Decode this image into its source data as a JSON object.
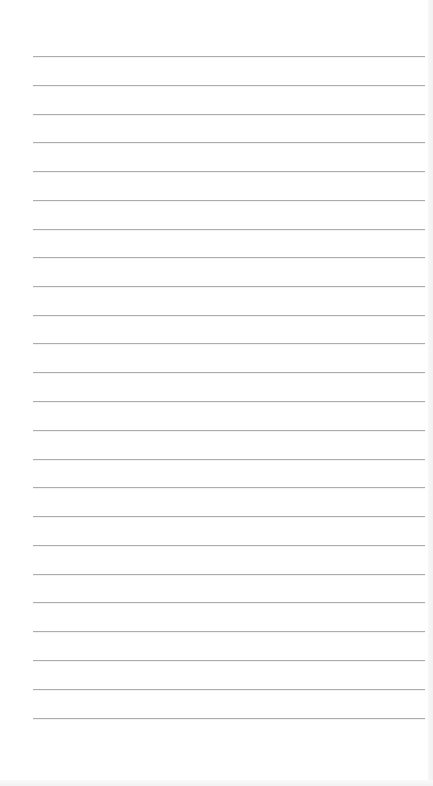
{
  "page": {
    "type": "ruled-paper",
    "background_color": "#ffffff",
    "line_color": "#adadad",
    "line_count": 24,
    "line_left": 33,
    "line_width": 392,
    "line_positions": [
      56,
      85,
      114,
      142,
      171,
      200,
      229,
      257,
      286,
      315,
      343,
      372,
      401,
      430,
      459,
      487,
      516,
      545,
      574,
      602,
      631,
      660,
      689,
      718
    ]
  }
}
